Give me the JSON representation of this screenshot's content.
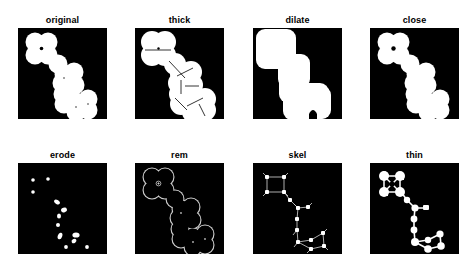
{
  "figure": {
    "background_color": "#ffffff",
    "panel_background_color": "#000000",
    "foreground_color": "#ffffff",
    "rows": 2,
    "columns": 4,
    "panel_width": 89,
    "panel_height": 91,
    "title_font_size_px": 9
  },
  "panels": [
    {
      "id": "original",
      "label": "original",
      "row": 0,
      "col": 0,
      "x": 18,
      "y": 28,
      "render": "filled"
    },
    {
      "id": "thick",
      "label": "thick",
      "row": 0,
      "col": 1,
      "x": 135,
      "y": 28,
      "render": "thick"
    },
    {
      "id": "dilate",
      "label": "dilate",
      "row": 0,
      "col": 2,
      "x": 253,
      "y": 28,
      "render": "dilate"
    },
    {
      "id": "close",
      "label": "close",
      "row": 0,
      "col": 3,
      "x": 370,
      "y": 28,
      "render": "filled"
    },
    {
      "id": "erode",
      "label": "erode",
      "row": 1,
      "col": 0,
      "x": 18,
      "y": 163,
      "render": "erode"
    },
    {
      "id": "rem",
      "label": "rem",
      "row": 1,
      "col": 1,
      "x": 135,
      "y": 163,
      "render": "outline"
    },
    {
      "id": "skel",
      "label": "skel",
      "row": 1,
      "col": 2,
      "x": 253,
      "y": 163,
      "render": "skel"
    },
    {
      "id": "thin",
      "label": "thin",
      "row": 1,
      "col": 3,
      "x": 370,
      "y": 163,
      "render": "thin"
    }
  ],
  "shape": {
    "description": "chain of overlapping discs forming a diagonal S from upper-left to lower-right, with a 2x2 disc cluster at top-left enclosing a small hole",
    "disc_radius": 9.5,
    "disc_centers": [
      [
        17,
        14
      ],
      [
        30,
        14
      ],
      [
        17,
        27
      ],
      [
        30,
        27
      ],
      [
        40,
        36
      ],
      [
        46,
        46
      ],
      [
        44,
        55
      ],
      [
        56,
        44
      ],
      [
        57,
        57
      ],
      [
        45,
        66
      ],
      [
        46,
        76
      ],
      [
        58,
        74
      ],
      [
        70,
        71
      ],
      [
        70,
        82
      ],
      [
        58,
        84
      ]
    ],
    "hole_center": [
      23.5,
      20.5
    ],
    "hole_radius": 1.6
  },
  "erode_points": [
    [
      17,
      14
    ],
    [
      30,
      14
    ],
    [
      17,
      27
    ],
    [
      40,
      36
    ],
    [
      46,
      46
    ],
    [
      44,
      55
    ],
    [
      56,
      44
    ],
    [
      57,
      57
    ],
    [
      45,
      66
    ],
    [
      46,
      76
    ],
    [
      58,
      74
    ],
    [
      70,
      71
    ],
    [
      70,
      82
    ],
    [
      58,
      84
    ]
  ],
  "skeleton": {
    "nodes": [
      [
        17,
        14
      ],
      [
        30,
        14
      ],
      [
        17,
        27
      ],
      [
        30,
        27
      ],
      [
        36,
        36
      ],
      [
        45,
        45
      ],
      [
        54,
        44
      ],
      [
        45,
        56
      ],
      [
        45,
        67
      ],
      [
        46,
        78
      ],
      [
        58,
        76
      ],
      [
        70,
        70
      ],
      [
        71,
        82
      ],
      [
        58,
        86
      ]
    ],
    "edges": [
      [
        0,
        1
      ],
      [
        0,
        2
      ],
      [
        1,
        3
      ],
      [
        2,
        3
      ],
      [
        3,
        4
      ],
      [
        4,
        5
      ],
      [
        5,
        6
      ],
      [
        5,
        7
      ],
      [
        7,
        8
      ],
      [
        8,
        9
      ],
      [
        9,
        10
      ],
      [
        10,
        11
      ],
      [
        11,
        12
      ],
      [
        12,
        13
      ],
      [
        13,
        9
      ]
    ]
  }
}
